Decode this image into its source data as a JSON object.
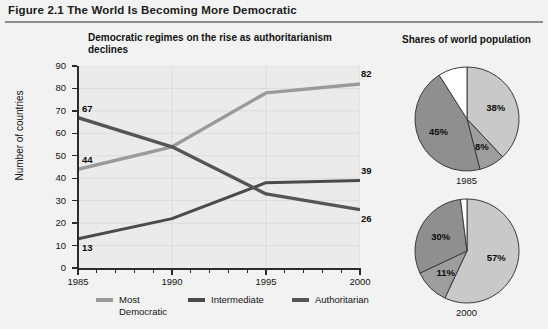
{
  "figure": {
    "label": "Figure 2.1",
    "title": "Figure 2.1  The World Is Becoming More Democratic"
  },
  "line_chart": {
    "title": "Democratic regimes on the rise as authoritarianism declines",
    "y_axis_label": "Number of countries",
    "legend": [
      {
        "label": "Most\nDemocratic",
        "color": "#9a9a9a"
      },
      {
        "label": "Intermediate",
        "color": "#4a4a4a"
      },
      {
        "label": "Authoritarian",
        "color": "#555555"
      }
    ]
  },
  "pies": {
    "heading": "Shares of world population",
    "items": [
      {
        "caption": "1985",
        "slices": [
          {
            "label": "38%",
            "value": 38,
            "color": "#c9c9c9"
          },
          {
            "label": "8%",
            "value": 8,
            "color": "#9d9d9d"
          },
          {
            "label": "45%",
            "value": 45,
            "color": "#8f8f8f"
          },
          {
            "label": "",
            "value": 9,
            "color": "#ffffff"
          }
        ]
      },
      {
        "caption": "2000",
        "slices": [
          {
            "label": "57%",
            "value": 57,
            "color": "#c9c9c9"
          },
          {
            "label": "11%",
            "value": 11,
            "color": "#9d9d9d"
          },
          {
            "label": "30%",
            "value": 30,
            "color": "#8f8f8f"
          },
          {
            "label": "",
            "value": 2,
            "color": "#ffffff"
          }
        ]
      }
    ]
  },
  "chart_data": [
    {
      "type": "line",
      "title": "Democratic regimes on the rise as authoritarianism declines",
      "xlabel": "",
      "ylabel": "Number of countries",
      "xlim": [
        1985,
        2000
      ],
      "ylim": [
        0,
        90
      ],
      "yticks": [
        0,
        10,
        20,
        30,
        40,
        50,
        60,
        70,
        80,
        90
      ],
      "xticks": [
        1985,
        1986,
        1987,
        1988,
        1989,
        1990,
        1991,
        1992,
        1993,
        1994,
        1995,
        1996,
        1997,
        1998,
        1999,
        2000
      ],
      "xtick_labels": [
        "1985",
        "",
        "",
        "",
        "",
        "1990",
        "",
        "",
        "",
        "",
        "1995",
        "",
        "",
        "",
        "",
        "2000"
      ],
      "grid": true,
      "legend_position": "bottom",
      "x": [
        1985,
        1990,
        1995,
        2000
      ],
      "series": [
        {
          "name": "Most Democratic",
          "color": "#9a9a9a",
          "values": [
            44,
            54,
            78,
            82
          ],
          "endpoint_labels": {
            "1985": "44",
            "2000": "82"
          }
        },
        {
          "name": "Intermediate",
          "color": "#4a4a4a",
          "values": [
            13,
            22,
            38,
            39
          ],
          "endpoint_labels": {
            "1985": "13",
            "2000": "39"
          }
        },
        {
          "name": "Authoritarian",
          "color": "#555555",
          "values": [
            67,
            54,
            33,
            26
          ],
          "endpoint_labels": {
            "1985": "67",
            "2000": "26"
          }
        }
      ]
    },
    {
      "type": "pie",
      "title": "Shares of world population",
      "subtitle": "1985",
      "labels": [
        "Most Democratic",
        "Intermediate",
        "Authoritarian",
        "Other"
      ],
      "values": [
        38,
        8,
        45,
        9
      ],
      "display_labels": [
        "38%",
        "8%",
        "45%",
        ""
      ]
    },
    {
      "type": "pie",
      "title": "Shares of world population",
      "subtitle": "2000",
      "labels": [
        "Most Democratic",
        "Intermediate",
        "Authoritarian",
        "Other"
      ],
      "values": [
        57,
        11,
        30,
        2
      ],
      "display_labels": [
        "57%",
        "11%",
        "30%",
        ""
      ]
    }
  ]
}
